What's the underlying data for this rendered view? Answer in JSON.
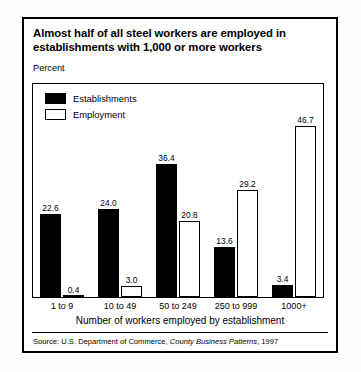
{
  "figure": {
    "title": "Almost half of all steel workers are employed in establishments with 1,000 or more workers",
    "y_axis_label": "Percent",
    "x_axis_title": "Number of workers employed by establishment",
    "source_prefix": "Source: U.S. Department of Commerce,",
    "source_italic": "County Business Patterns",
    "source_suffix": ", 1997"
  },
  "chart_data": {
    "type": "bar",
    "title": "Almost half of all steel workers are employed in establishments with 1,000 or more workers",
    "xlabel": "Number of workers employed by establishment",
    "ylabel": "Percent",
    "ylim": [
      0,
      50
    ],
    "grid": false,
    "legend_position": "top-left",
    "categories": [
      "1 to 9",
      "10 to 49",
      "50 to 249",
      "250 to 999",
      "1000+"
    ],
    "series": [
      {
        "name": "Establishments",
        "color": "#000000",
        "fill": "solid",
        "values": [
          22.6,
          24.0,
          36.4,
          13.6,
          3.4
        ],
        "labels": [
          "22.6",
          "24.0",
          "36.4",
          "13.6",
          "3.4"
        ]
      },
      {
        "name": "Employment",
        "color": "#ffffff",
        "fill": "hollow",
        "values": [
          0.4,
          3.0,
          20.8,
          29.2,
          46.7
        ],
        "labels": [
          "0.4",
          "3.0",
          "20.8",
          "29.2",
          "46.7"
        ]
      }
    ]
  },
  "colors": {
    "ink": "#000000",
    "paper": "#ffffff",
    "page": "#fdfdfb"
  }
}
